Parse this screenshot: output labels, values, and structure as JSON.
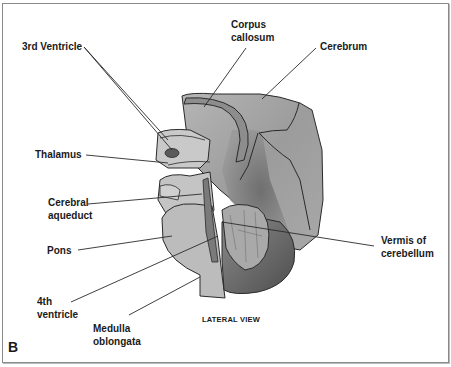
{
  "figure": {
    "panel_label": "B",
    "caption": "LATERAL VIEW",
    "colors": {
      "border": "#8a8a8a",
      "outline": "#2a2a2a",
      "light_gray": "#bdbdbd",
      "mid_gray": "#a6a6a6",
      "dark_gray": "#6e6e6e",
      "ventricle": "#5a5a5a",
      "text": "#1a1a1a"
    }
  },
  "labels": {
    "third_ventricle": "3rd Ventricle",
    "corpus_callosum": "Corpus\ncallosum",
    "cerebrum": "Cerebrum",
    "thalamus": "Thalamus",
    "cerebral_aqueduct": "Cerebral\naqueduct",
    "pons": "Pons",
    "fourth_ventricle": "4th\nventricle",
    "medulla_oblongata": "Medulla\noblongata",
    "vermis_of_cerebellum": "Vermis of\ncerebellum"
  }
}
